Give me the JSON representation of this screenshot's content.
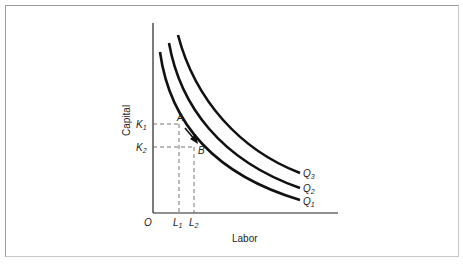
{
  "diagram": {
    "type": "isoquant-map",
    "x_axis_label": "Labor",
    "y_axis_label": "Capital",
    "origin_label": "O",
    "curves": [
      {
        "id": "Q1",
        "label": "Q",
        "sub": "1"
      },
      {
        "id": "Q2",
        "label": "Q",
        "sub": "2"
      },
      {
        "id": "Q3",
        "label": "Q",
        "sub": "3"
      }
    ],
    "points": [
      {
        "id": "A",
        "label": "A"
      },
      {
        "id": "B",
        "label": "B"
      }
    ],
    "y_ticks": [
      {
        "label": "K",
        "sub": "1"
      },
      {
        "label": "K",
        "sub": "2"
      }
    ],
    "x_ticks": [
      {
        "label": "L",
        "sub": "1"
      },
      {
        "label": "L",
        "sub": "2"
      }
    ],
    "colors": {
      "curve": "#111111",
      "axis": "#222222",
      "dashed": "#666666",
      "frame": "#9a9a9a"
    }
  }
}
